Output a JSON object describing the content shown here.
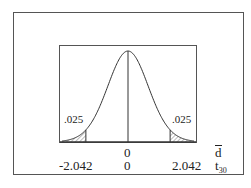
{
  "chart_data": {
    "type": "area",
    "title": "",
    "curve": "t-distribution",
    "df": 30,
    "tail_areas": {
      "left": ".025",
      "right": ".025"
    },
    "critical_values": [
      -2.042,
      2.042
    ],
    "center": 0,
    "axes": [
      {
        "name": "d_bar",
        "label": "d",
        "label_overline": true,
        "ticks": [
          "0"
        ]
      },
      {
        "name": "t30",
        "label": "t",
        "label_subscript": "30",
        "ticks": [
          "-2.042",
          "0",
          "2.042"
        ]
      }
    ],
    "xlim": [
      -3.2,
      3.2
    ]
  },
  "labels": {
    "tail_left": ".025",
    "tail_right": ".025",
    "dbar_zero": "0",
    "t_neg": "-2.042",
    "t_zero": "0",
    "t_pos": "2.042",
    "dbar_axis": "d",
    "t_axis": "t",
    "t_sub": "30"
  },
  "colors": {
    "line": "#333333",
    "hatch": "#555555",
    "background": "#ffffff"
  }
}
